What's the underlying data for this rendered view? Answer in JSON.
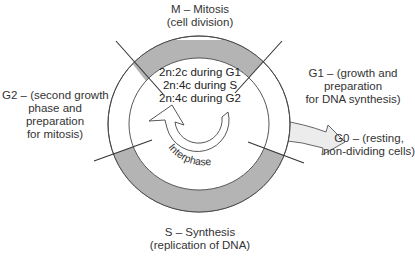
{
  "diagram": {
    "type": "cell-cycle",
    "colors": {
      "ring_fill": "#b4b4b4",
      "line": "#333333",
      "arrow_fill": "#ececec",
      "background": "#ffffff"
    },
    "phases": {
      "M": {
        "line1": "M – Mitosis",
        "line2": "(cell division)"
      },
      "G1": {
        "line1": "G1 – (growth and",
        "line2": "preparation",
        "line3": "for DNA synthesis)"
      },
      "G2": {
        "line1": "G2 – (second growth",
        "line2": "phase and",
        "line3": "preparation",
        "line4": "for mitosis)"
      },
      "S": {
        "line1": "S – Synthesis",
        "line2": "(replication of DNA)"
      },
      "G0": {
        "line1": "G0 – (resting,",
        "line2": "non-dividing cells)"
      }
    },
    "ploidy": {
      "g1": "2n:2c during G1",
      "s": "2n:4c during S",
      "g2": "2n:4c during G2"
    },
    "interphase_label": "Interphase",
    "icons": {
      "cycle_arrow": "circular-arrow-icon",
      "exit_arrow": "arrow-right-icon"
    }
  }
}
